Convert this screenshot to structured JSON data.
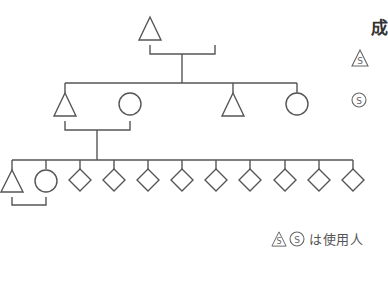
{
  "diagram": {
    "type": "kinship-chart",
    "stroke_color": "#555555",
    "generations": [
      {
        "level": 1,
        "members": [
          {
            "shape": "triangle",
            "x": 150
          }
        ]
      },
      {
        "level": 2,
        "members": [
          {
            "shape": "triangle",
            "x": 65
          },
          {
            "shape": "circle",
            "x": 130
          },
          {
            "shape": "triangle",
            "x": 233
          },
          {
            "shape": "circle",
            "x": 297
          }
        ]
      },
      {
        "level": 3,
        "members": [
          {
            "shape": "triangle",
            "x": 12
          },
          {
            "shape": "circle",
            "x": 46
          },
          {
            "shape": "diamond",
            "x": 80
          },
          {
            "shape": "diamond",
            "x": 114
          },
          {
            "shape": "diamond",
            "x": 148
          },
          {
            "shape": "diamond",
            "x": 182
          },
          {
            "shape": "diamond",
            "x": 216
          },
          {
            "shape": "diamond",
            "x": 250
          },
          {
            "shape": "diamond",
            "x": 285
          },
          {
            "shape": "diamond",
            "x": 319
          },
          {
            "shape": "diamond",
            "x": 353
          }
        ]
      }
    ]
  },
  "legend": {
    "title": "成",
    "items": [
      {
        "icon": "servant-male-triangle-icon",
        "label": "S"
      },
      {
        "icon": "servant-female-circle-icon",
        "label": "S"
      }
    ]
  },
  "caption": {
    "symbol_s": "S",
    "text": "は使用人"
  }
}
